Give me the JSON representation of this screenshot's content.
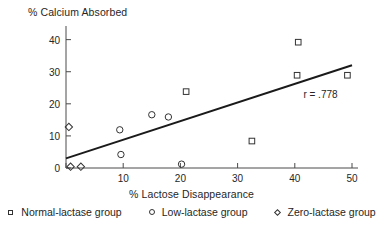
{
  "chart_data": {
    "type": "scatter",
    "title": "",
    "ylabel": "% Calcium Absorbed",
    "xlabel": "% Lactose Disappearance",
    "xlim": [
      0,
      50
    ],
    "ylim": [
      0,
      43
    ],
    "xticks": [
      0,
      10,
      20,
      30,
      40,
      50
    ],
    "yticks": [
      0,
      10,
      20,
      30,
      40
    ],
    "grid": false,
    "legend_position": "bottom",
    "annotations": [
      {
        "text": "r = .778",
        "x": 41.5,
        "y": 24.5
      }
    ],
    "trendline": {
      "x": [
        0,
        50
      ],
      "y": [
        3.0,
        32.0
      ],
      "color": "#1a1a1a"
    },
    "series": [
      {
        "name": "Normal-lactase group",
        "marker": "square",
        "points": [
          {
            "x": 21.0,
            "y": 23.8
          },
          {
            "x": 32.5,
            "y": 8.4
          },
          {
            "x": 40.6,
            "y": 39.2
          },
          {
            "x": 40.4,
            "y": 28.9
          },
          {
            "x": 49.2,
            "y": 28.9
          }
        ]
      },
      {
        "name": "Low-lactase group",
        "marker": "circle",
        "points": [
          {
            "x": 9.4,
            "y": 11.9
          },
          {
            "x": 9.6,
            "y": 4.2
          },
          {
            "x": 15.0,
            "y": 16.6
          },
          {
            "x": 17.9,
            "y": 15.9
          },
          {
            "x": 20.2,
            "y": 1.2
          }
        ]
      },
      {
        "name": "Zero-lactase group",
        "marker": "diamond",
        "points": [
          {
            "x": 0.5,
            "y": 12.8
          },
          {
            "x": 0.8,
            "y": 0.4
          },
          {
            "x": 2.6,
            "y": 0.4
          }
        ]
      }
    ]
  },
  "legend": {
    "items": [
      {
        "label": "Normal-lactase group",
        "marker": "square"
      },
      {
        "label": "Low-lactase group",
        "marker": "circle"
      },
      {
        "label": "Zero-lactase group",
        "marker": "diamond"
      }
    ]
  }
}
